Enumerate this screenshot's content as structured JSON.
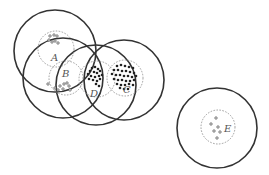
{
  "diagram": {
    "type": "clusters-with-coverage-circles",
    "clusters": [
      {
        "label": "A",
        "outer": {
          "cx": 55,
          "cy": 51,
          "r": 41
        },
        "inner": {
          "cx": 56,
          "cy": 49,
          "r": 18
        },
        "label_pos": {
          "x": 51,
          "y": 61
        },
        "point_style": "hollow",
        "points": [
          [
            50,
            36
          ],
          [
            54,
            35
          ],
          [
            57,
            36
          ],
          [
            49,
            40
          ],
          [
            52,
            42
          ],
          [
            55,
            41
          ],
          [
            58,
            43
          ]
        ]
      },
      {
        "label": "B",
        "outer": {
          "cx": 63,
          "cy": 78,
          "r": 40
        },
        "inner": {
          "cx": 66,
          "cy": 78,
          "r": 17
        },
        "label_pos": {
          "x": 62,
          "y": 77
        },
        "point_style": "hollow",
        "points": [
          [
            48,
            84
          ],
          [
            55,
            88
          ],
          [
            60,
            86
          ],
          [
            64,
            84
          ],
          [
            67,
            83
          ],
          [
            69,
            86
          ],
          [
            63,
            89
          ],
          [
            70,
            90
          ],
          [
            58,
            90
          ]
        ]
      },
      {
        "label": "D",
        "outer": {
          "cx": 96,
          "cy": 85,
          "r": 40
        },
        "inner": {
          "cx": 97,
          "cy": 79,
          "r": 18
        },
        "label_pos": {
          "x": 90,
          "y": 97
        },
        "point_style": "solid",
        "points": [
          [
            92,
            68
          ],
          [
            95,
            67
          ],
          [
            98,
            69
          ],
          [
            90,
            71
          ],
          [
            94,
            72
          ],
          [
            97,
            73
          ],
          [
            100,
            71
          ],
          [
            88,
            74
          ],
          [
            91,
            76
          ],
          [
            95,
            77
          ],
          [
            99,
            76
          ],
          [
            102,
            75
          ],
          [
            93,
            80
          ],
          [
            97,
            81
          ],
          [
            100,
            79
          ],
          [
            89,
            79
          ],
          [
            96,
            84
          ],
          [
            99,
            86
          ]
        ]
      },
      {
        "label": "C",
        "outer": {
          "cx": 124,
          "cy": 80,
          "r": 40
        },
        "inner": {
          "cx": 125,
          "cy": 78,
          "r": 18
        },
        "label_pos": {
          "x": 123,
          "y": 93
        },
        "point_style": "solid",
        "points": [
          [
            117,
            66
          ],
          [
            121,
            65
          ],
          [
            125,
            66
          ],
          [
            129,
            67
          ],
          [
            133,
            68
          ],
          [
            114,
            70
          ],
          [
            118,
            70
          ],
          [
            122,
            71
          ],
          [
            126,
            71
          ],
          [
            130,
            72
          ],
          [
            134,
            73
          ],
          [
            112,
            74
          ],
          [
            116,
            75
          ],
          [
            120,
            75
          ],
          [
            124,
            76
          ],
          [
            128,
            76
          ],
          [
            132,
            77
          ],
          [
            136,
            76
          ],
          [
            114,
            79
          ],
          [
            118,
            80
          ],
          [
            122,
            80
          ],
          [
            126,
            81
          ],
          [
            130,
            81
          ],
          [
            134,
            80
          ],
          [
            117,
            84
          ],
          [
            121,
            85
          ],
          [
            125,
            85
          ],
          [
            129,
            84
          ],
          [
            133,
            85
          ],
          [
            120,
            88
          ],
          [
            124,
            89
          ],
          [
            128,
            89
          ]
        ]
      },
      {
        "label": "E",
        "outer": {
          "cx": 217,
          "cy": 128,
          "r": 40
        },
        "inner": {
          "cx": 218,
          "cy": 127,
          "r": 17
        },
        "label_pos": {
          "x": 224,
          "y": 132
        },
        "point_style": "hollow",
        "points": [
          [
            216,
            118
          ],
          [
            211,
            124
          ],
          [
            218,
            127
          ],
          [
            214,
            131
          ],
          [
            220,
            132
          ],
          [
            217,
            138
          ]
        ]
      }
    ]
  }
}
